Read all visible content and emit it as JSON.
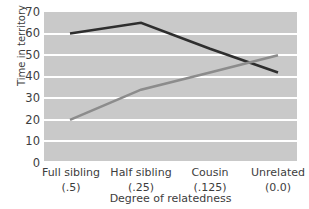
{
  "chart_data": {
    "type": "line",
    "title": "",
    "xlabel": "Degree of relatedness",
    "ylabel": "Time in territory",
    "categories": [
      "Full sibling",
      "Half sibling",
      "Cousin",
      "Unrelated"
    ],
    "category_sublabels": [
      "(.5)",
      "(.25)",
      "(.125)",
      "(0.0)"
    ],
    "ylim": [
      0,
      70
    ],
    "yticks": [
      70,
      60,
      50,
      40,
      30,
      20,
      10,
      0
    ],
    "grid": true,
    "legend": "none",
    "plot_background": "#c9c9c9",
    "gridline_color": "#ffffff",
    "series": [
      {
        "name": "dark-series",
        "color": "#2e2e2e",
        "values": [
          60,
          65,
          53,
          42
        ]
      },
      {
        "name": "gray-series",
        "color": "#8c8c8c",
        "values": [
          20,
          34,
          42,
          50
        ]
      }
    ]
  }
}
